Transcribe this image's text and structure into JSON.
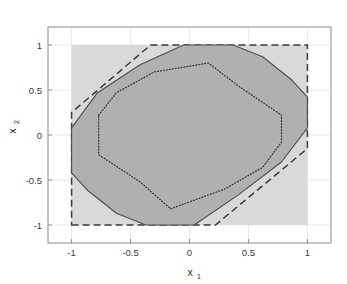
{
  "chart_data": {
    "type": "area",
    "title": "",
    "xlabel": "x_1",
    "ylabel": "x_2",
    "xlabel_base": "x",
    "xlabel_sub": "1",
    "ylabel_base": "x",
    "ylabel_sub": "2",
    "xlim": [
      -1.2,
      1.2
    ],
    "ylim": [
      -1.2,
      1.2
    ],
    "xticks": [
      -1,
      -0.5,
      0,
      0.5,
      1
    ],
    "xticklabels": [
      "-1",
      "-0.5",
      "0",
      "0.5",
      "1"
    ],
    "yticks": [
      -1,
      -0.5,
      0,
      0.5,
      1
    ],
    "yticklabels": [
      "-1",
      "-0.5",
      "0",
      "0.5",
      "1"
    ],
    "grid": true,
    "legend": "none",
    "colors": {
      "outer_square_fill": "#d9d9d9",
      "inner_region_fill": "#b0b0b0",
      "region_edge": "#4d4d4d",
      "dashed_edge": "#3a3a3a",
      "dotted_edge": "#333333",
      "axis": "#8c8c8c",
      "grid": "#eaeaea",
      "text": "#333333",
      "background": "#ffffff"
    },
    "series": [
      {
        "name": "outer-box-region",
        "style": "filled-square",
        "fill": "#d9d9d9",
        "edge": "none",
        "points": [
          [
            -1,
            -1
          ],
          [
            1,
            -1
          ],
          [
            1,
            1
          ],
          [
            -1,
            1
          ]
        ]
      },
      {
        "name": "dashed-outer-polygon",
        "style": "dashed",
        "fill": "none",
        "edge": "#3a3a3a",
        "points": [
          [
            -1,
            -1
          ],
          [
            0.22,
            -1
          ],
          [
            1,
            -0.15
          ],
          [
            1,
            1
          ],
          [
            -0.33,
            1
          ],
          [
            -1,
            0.25
          ]
        ]
      },
      {
        "name": "solid-inner-region",
        "style": "solid-filled",
        "fill": "#b0b0b0",
        "edge": "#4d4d4d",
        "points": [
          [
            -1,
            0.08
          ],
          [
            -0.78,
            0.47
          ],
          [
            -0.42,
            0.78
          ],
          [
            -0.05,
            1.0
          ],
          [
            0.37,
            1.0
          ],
          [
            0.62,
            0.87
          ],
          [
            0.86,
            0.62
          ],
          [
            1.0,
            0.42
          ],
          [
            1.0,
            0.08
          ],
          [
            0.78,
            -0.3
          ],
          [
            0.42,
            -0.66
          ],
          [
            0.04,
            -1.0
          ],
          [
            -0.37,
            -1.0
          ],
          [
            -0.62,
            -0.87
          ],
          [
            -0.86,
            -0.62
          ],
          [
            -1.0,
            -0.42
          ]
        ]
      },
      {
        "name": "dotted-inner-polygon",
        "style": "dotted",
        "fill": "none",
        "edge": "#333333",
        "points": [
          [
            -0.77,
            0.22
          ],
          [
            -0.62,
            0.47
          ],
          [
            -0.3,
            0.7
          ],
          [
            0.16,
            0.8
          ],
          [
            0.42,
            0.54
          ],
          [
            0.78,
            0.22
          ],
          [
            0.78,
            -0.08
          ],
          [
            0.62,
            -0.36
          ],
          [
            0.3,
            -0.6
          ],
          [
            -0.16,
            -0.82
          ],
          [
            -0.42,
            -0.52
          ],
          [
            -0.77,
            -0.22
          ]
        ]
      }
    ]
  }
}
